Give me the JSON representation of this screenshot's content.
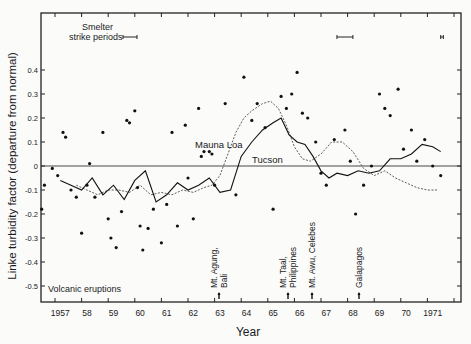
{
  "chart_data": {
    "type": "scatter",
    "title": "",
    "xlabel": "Year",
    "ylabel": "Linke turbidity factor (departure from normal)",
    "xlim": [
      1956.4,
      1972.3
    ],
    "ylim": [
      -0.62,
      0.65
    ],
    "x_tick_labels": [
      "1957",
      "58",
      "59",
      "60",
      "61",
      "62",
      "63",
      "64",
      "65",
      "66",
      "67",
      "68",
      "69",
      "70",
      "1971"
    ],
    "y_tick_labels": [
      "0.4",
      "0.3",
      "0.2",
      "0.1",
      "0",
      "-0.1",
      "-0.2",
      "-0.3",
      "-0.4",
      "-0.5"
    ],
    "y_ticks": [
      0.4,
      0.3,
      0.2,
      0.1,
      0,
      -0.1,
      -0.2,
      -0.3,
      -0.4,
      -0.5
    ],
    "grid": false,
    "zero_line": true,
    "series": [
      {
        "name": "Mauna Loa",
        "style": "thin line (dashed where data sparse)",
        "x": [
          1957.8,
          1958.2,
          1958.6,
          1959.0,
          1959.4,
          1959.8,
          1960.2,
          1960.6,
          1961.0,
          1961.4,
          1961.8,
          1962.2,
          1962.6,
          1962.9,
          1963.2,
          1963.5,
          1963.8,
          1964.1,
          1964.4,
          1964.8,
          1965.1,
          1965.4,
          1965.7,
          1966.0,
          1966.3,
          1966.6,
          1967.0,
          1967.4,
          1967.8,
          1968.2,
          1968.6,
          1969.0,
          1969.4,
          1969.8,
          1970.2,
          1970.6,
          1971.0,
          1971.4
        ],
        "values": [
          -0.08,
          -0.1,
          -0.12,
          -0.1,
          -0.1,
          -0.11,
          -0.08,
          -0.12,
          -0.11,
          -0.12,
          -0.1,
          -0.11,
          -0.09,
          -0.08,
          -0.04,
          0.05,
          0.14,
          0.2,
          0.23,
          0.26,
          0.27,
          0.24,
          0.17,
          0.08,
          0.03,
          0.02,
          0.05,
          0.1,
          0.1,
          0.06,
          -0.01,
          -0.04,
          -0.02,
          -0.05,
          -0.07,
          -0.09,
          -0.1,
          -0.1
        ]
      },
      {
        "name": "Tucson",
        "style": "solid line",
        "x": [
          1957.2,
          1957.6,
          1958.0,
          1958.4,
          1958.8,
          1959.2,
          1959.6,
          1960.0,
          1960.4,
          1960.8,
          1961.2,
          1961.6,
          1962.0,
          1962.4,
          1962.8,
          1963.2,
          1963.6,
          1964.0,
          1964.4,
          1964.8,
          1965.2,
          1965.5,
          1965.8,
          1966.1,
          1966.4,
          1966.7,
          1967.0,
          1967.3,
          1967.6,
          1968.0,
          1968.4,
          1968.8,
          1969.2,
          1969.6,
          1970.0,
          1970.4,
          1970.8,
          1971.2,
          1971.5
        ],
        "values": [
          -0.06,
          -0.08,
          -0.1,
          -0.05,
          -0.12,
          -0.08,
          -0.14,
          -0.06,
          -0.02,
          -0.15,
          -0.12,
          -0.07,
          -0.1,
          -0.08,
          -0.05,
          -0.11,
          -0.1,
          0.04,
          0.1,
          0.15,
          0.18,
          0.2,
          0.13,
          0.1,
          0.09,
          0.04,
          -0.02,
          -0.05,
          -0.03,
          -0.04,
          -0.02,
          -0.03,
          -0.02,
          0.03,
          0.03,
          0.05,
          0.09,
          0.08,
          0.06
        ]
      },
      {
        "name": "observations",
        "style": "dots",
        "points": [
          [
            1956.5,
            -0.18
          ],
          [
            1956.6,
            -0.08
          ],
          [
            1956.9,
            -0.01
          ],
          [
            1957.1,
            -0.04
          ],
          [
            1957.3,
            0.14
          ],
          [
            1957.4,
            0.12
          ],
          [
            1957.6,
            -0.1
          ],
          [
            1957.8,
            -0.13
          ],
          [
            1958.0,
            -0.28
          ],
          [
            1958.2,
            -0.08
          ],
          [
            1958.3,
            0.01
          ],
          [
            1958.5,
            -0.13
          ],
          [
            1958.8,
            0.14
          ],
          [
            1959.0,
            -0.22
          ],
          [
            1959.1,
            -0.3
          ],
          [
            1959.3,
            -0.34
          ],
          [
            1959.5,
            -0.19
          ],
          [
            1959.7,
            0.19
          ],
          [
            1959.8,
            0.18
          ],
          [
            1960.0,
            0.23
          ],
          [
            1960.1,
            -0.09
          ],
          [
            1960.2,
            -0.25
          ],
          [
            1960.3,
            -0.35
          ],
          [
            1960.5,
            -0.26
          ],
          [
            1960.7,
            -0.18
          ],
          [
            1961.0,
            -0.32
          ],
          [
            1961.2,
            -0.16
          ],
          [
            1961.4,
            0.14
          ],
          [
            1961.6,
            -0.25
          ],
          [
            1961.9,
            0.17
          ],
          [
            1962.0,
            -0.05
          ],
          [
            1962.2,
            -0.22
          ],
          [
            1962.4,
            0.24
          ],
          [
            1962.5,
            0.04
          ],
          [
            1962.6,
            0.06
          ],
          [
            1962.8,
            0.06
          ],
          [
            1962.9,
            0.05
          ],
          [
            1963.0,
            -0.08
          ],
          [
            1963.4,
            0.26
          ],
          [
            1963.8,
            -0.12
          ],
          [
            1964.1,
            0.37
          ],
          [
            1964.4,
            0.19
          ],
          [
            1964.6,
            0.26
          ],
          [
            1964.9,
            0.16
          ],
          [
            1965.2,
            -0.18
          ],
          [
            1965.5,
            0.29
          ],
          [
            1965.7,
            0.24
          ],
          [
            1965.9,
            0.3
          ],
          [
            1966.1,
            0.39
          ],
          [
            1966.3,
            0.22
          ],
          [
            1966.5,
            0.2
          ],
          [
            1966.8,
            0.1
          ],
          [
            1967.0,
            -0.03
          ],
          [
            1967.2,
            -0.08
          ],
          [
            1967.5,
            0.11
          ],
          [
            1967.9,
            0.15
          ],
          [
            1968.1,
            0.02
          ],
          [
            1968.3,
            -0.2
          ],
          [
            1968.6,
            -0.08
          ],
          [
            1968.9,
            0.0
          ],
          [
            1969.2,
            0.3
          ],
          [
            1969.4,
            0.24
          ],
          [
            1969.6,
            0.21
          ],
          [
            1969.9,
            0.32
          ],
          [
            1970.1,
            0.07
          ],
          [
            1970.4,
            0.15
          ],
          [
            1970.6,
            0.02
          ],
          [
            1970.9,
            0.11
          ],
          [
            1971.2,
            0.0
          ],
          [
            1971.5,
            -0.04
          ]
        ]
      }
    ],
    "annotations": {
      "series_labels": [
        {
          "text": "Mauna Loa",
          "x": 1963.6,
          "y": 0.09
        },
        {
          "text": "Tucson",
          "x": 1964.6,
          "y": 0.03
        }
      ],
      "smelter_strike": {
        "label_line1": "Smelter",
        "label_line2": "strike periods",
        "periods": [
          [
            1959.5,
            1960.1
          ],
          [
            1967.6,
            1968.2
          ],
          [
            1971.5,
            1971.6
          ]
        ]
      },
      "volcanic": {
        "label": "Volcanic eruptions",
        "events": [
          {
            "name_line1": "Mt. Agung,",
            "name_line2": "Bali",
            "year": 1963.2
          },
          {
            "name_line1": "Mt. Taal,",
            "name_line2": "Philippines",
            "year": 1965.7
          },
          {
            "name_line1": "Mt. Awu, Celebes",
            "name_line2": "",
            "year": 1966.5
          },
          {
            "name_line1": "Galapagos",
            "name_line2": "",
            "year": 1968.3
          }
        ]
      }
    }
  }
}
